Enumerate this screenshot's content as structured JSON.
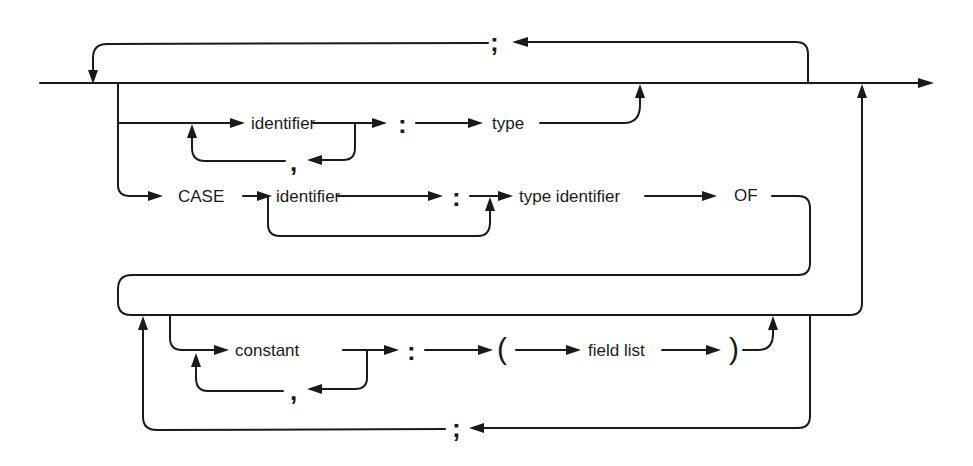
{
  "diagram": {
    "type": "syntax-diagram",
    "subject": "field list",
    "row1": {
      "identifier": "identifier",
      "colon": ":",
      "type": "type",
      "separator": ","
    },
    "row2": {
      "case_keyword": "CASE",
      "identifier": "identifier",
      "colon": ":",
      "type_identifier": "type identifier",
      "of_keyword": "OF"
    },
    "row3": {
      "constant": "constant",
      "separator": ",",
      "colon": ":",
      "open_paren": "(",
      "field_list": "field list",
      "close_paren": ")"
    },
    "top_loop_separator": ";",
    "bottom_loop_separator": ";"
  }
}
